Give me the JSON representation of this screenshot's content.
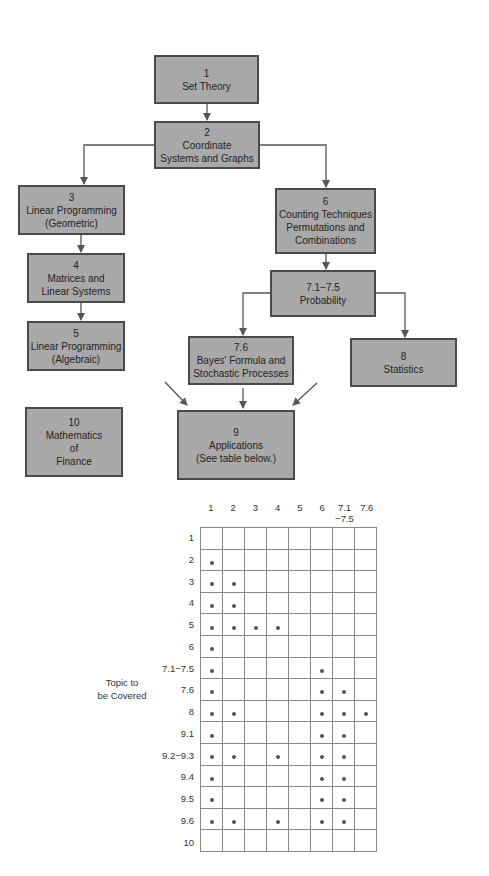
{
  "diagram": {
    "boxes": [
      {
        "id": "1",
        "lines": [
          "1",
          "Set Theory"
        ]
      },
      {
        "id": "2",
        "lines": [
          "2",
          "Coordinate",
          "Systems and Graphs"
        ]
      },
      {
        "id": "3",
        "lines": [
          "3",
          "Linear Programming",
          "(Geometric)"
        ]
      },
      {
        "id": "4",
        "lines": [
          "4",
          "Matrices and",
          "Linear Systems"
        ]
      },
      {
        "id": "5",
        "lines": [
          "5",
          "Linear Programming",
          "(Algebraic)"
        ]
      },
      {
        "id": "6",
        "lines": [
          "6",
          "Counting Techniques",
          "Permutations and",
          "Combinations"
        ]
      },
      {
        "id": "7.1-7.5",
        "lines": [
          "7.1−7.5",
          "Probability"
        ]
      },
      {
        "id": "7.6",
        "lines": [
          "7.6",
          "Bayes' Formula and",
          "Stochastic Processes"
        ]
      },
      {
        "id": "8",
        "lines": [
          "8",
          "Statistics"
        ]
      },
      {
        "id": "10",
        "lines": [
          "10",
          "Mathematics",
          "of",
          "Finance"
        ]
      },
      {
        "id": "9",
        "lines": [
          "9",
          "Applications",
          "(See table below.)"
        ]
      }
    ],
    "edges": [
      {
        "from": "1",
        "to": "2"
      },
      {
        "from": "2",
        "to": "3"
      },
      {
        "from": "2",
        "to": "6"
      },
      {
        "from": "3",
        "to": "4"
      },
      {
        "from": "4",
        "to": "5"
      },
      {
        "from": "6",
        "to": "7.1-7.5"
      },
      {
        "from": "7.1-7.5",
        "to": "7.6"
      },
      {
        "from": "7.1-7.5",
        "to": "8"
      },
      {
        "from": "7.6",
        "to": "9"
      },
      {
        "from": "(left)",
        "to": "9"
      },
      {
        "from": "(right)",
        "to": "9"
      }
    ]
  },
  "table": {
    "row_axis_label": [
      "Topic to",
      "be Covered"
    ],
    "columns": [
      {
        "label": "1"
      },
      {
        "label": "2"
      },
      {
        "label": "3"
      },
      {
        "label": "4"
      },
      {
        "label": "5"
      },
      {
        "label": "6"
      },
      {
        "label": "7.1",
        "label2": "−7.5"
      },
      {
        "label": "7.6"
      }
    ],
    "rows": [
      {
        "label": "1",
        "marks": [
          0,
          0,
          0,
          0,
          0,
          0,
          0,
          0
        ]
      },
      {
        "label": "2",
        "marks": [
          1,
          0,
          0,
          0,
          0,
          0,
          0,
          0
        ]
      },
      {
        "label": "3",
        "marks": [
          1,
          1,
          0,
          0,
          0,
          0,
          0,
          0
        ]
      },
      {
        "label": "4",
        "marks": [
          1,
          1,
          0,
          0,
          0,
          0,
          0,
          0
        ]
      },
      {
        "label": "5",
        "marks": [
          1,
          1,
          1,
          1,
          0,
          0,
          0,
          0
        ]
      },
      {
        "label": "6",
        "marks": [
          1,
          0,
          0,
          0,
          0,
          0,
          0,
          0
        ]
      },
      {
        "label": "7.1−7.5",
        "marks": [
          1,
          0,
          0,
          0,
          0,
          1,
          0,
          0
        ]
      },
      {
        "label": "7.6",
        "marks": [
          1,
          0,
          0,
          0,
          0,
          1,
          1,
          0
        ]
      },
      {
        "label": "8",
        "marks": [
          1,
          1,
          0,
          0,
          0,
          1,
          1,
          1
        ]
      },
      {
        "label": "9.1",
        "marks": [
          1,
          0,
          0,
          0,
          0,
          1,
          1,
          0
        ]
      },
      {
        "label": "9.2−9.3",
        "marks": [
          1,
          1,
          0,
          1,
          0,
          1,
          1,
          0
        ]
      },
      {
        "label": "9.4",
        "marks": [
          1,
          0,
          0,
          0,
          0,
          1,
          1,
          0
        ]
      },
      {
        "label": "9.5",
        "marks": [
          1,
          0,
          0,
          0,
          0,
          1,
          1,
          0
        ]
      },
      {
        "label": "9.6",
        "marks": [
          1,
          1,
          0,
          1,
          0,
          1,
          1,
          0
        ]
      },
      {
        "label": "10",
        "marks": [
          0,
          0,
          0,
          0,
          0,
          0,
          0,
          0
        ]
      }
    ]
  },
  "colors": {
    "box_fill": "#a9a9a9",
    "box_border": "#4a4a4a",
    "line": "#555555",
    "grid": "#8a8a8a",
    "dot": "#555555"
  }
}
